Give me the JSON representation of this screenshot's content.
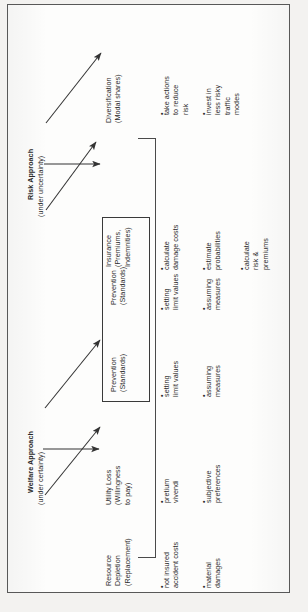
{
  "diagram": {
    "type": "flow-diagram",
    "orientation": "rotated-90-ccw",
    "title_note": "Valuation approaches for external effects",
    "approaches": [
      {
        "id": "risk",
        "heading": "Risk Approach",
        "subheading": "(under uncertainty)",
        "branches": [
          {
            "id": "diversification",
            "label_line1": "Diversification",
            "label_line2": "(Modal shares)",
            "boxed": false,
            "bullets": [
              {
                "marker": "•",
                "lines": [
                  "take actions",
                  "to reduce",
                  "risk"
                ]
              },
              {
                "marker": "•",
                "lines": [
                  "invest in",
                  "less risky",
                  "traffic",
                  "modes"
                ]
              }
            ]
          },
          {
            "id": "insurance",
            "label_line1": "Insurance",
            "label_line2": "(Premiums,",
            "label_line3": "Indemnities)",
            "boxed": false,
            "bullets": [
              {
                "marker": "•",
                "lines": [
                  "calculate",
                  "damage costs"
                ]
              },
              {
                "marker": "•",
                "lines": [
                  "estimate",
                  "probabilities"
                ]
              },
              {
                "marker": "•",
                "lines": [
                  "calculate",
                  "risk &",
                  "premiums"
                ]
              }
            ]
          },
          {
            "id": "prevention-risk",
            "label_line1": "Prevention",
            "label_line2": "(Standards)",
            "boxed": true,
            "bullets": [
              {
                "marker": "•",
                "lines": [
                  "setting",
                  "limit values"
                ]
              },
              {
                "marker": "•",
                "lines": [
                  "assuming",
                  "measures"
                ]
              }
            ]
          }
        ]
      },
      {
        "id": "welfare",
        "heading": "Welfare Approach",
        "subheading": "(under certainty)",
        "branches": [
          {
            "id": "prevention-welfare",
            "label_line1": "Prevention",
            "label_line2": "(Standards)",
            "boxed": true,
            "bullets": [
              {
                "marker": "•",
                "lines": [
                  "setting",
                  "limit values"
                ]
              },
              {
                "marker": "•",
                "lines": [
                  "assuming",
                  "measures"
                ]
              }
            ]
          },
          {
            "id": "utility-loss",
            "label_line1": "Utility Loss",
            "label_line2": "(Willingness",
            "label_line3": "to   pay)",
            "boxed": false,
            "bullets": [
              {
                "marker": "•",
                "lines": [
                  "pretium",
                  "vivendi"
                ]
              },
              {
                "marker": "•",
                "lines": [
                  "subjective",
                  "preferences"
                ]
              }
            ]
          },
          {
            "id": "resource-depletion",
            "label_line1": "Resource",
            "label_line2": "Depletion",
            "label_line3": "(Replacement)",
            "boxed": false,
            "bullets": [
              {
                "marker": "•",
                "lines": [
                  "not insured",
                  "accident costs"
                ]
              },
              {
                "marker": "•",
                "lines": [
                  "material",
                  "damages"
                ]
              }
            ]
          }
        ]
      }
    ],
    "colors": {
      "ink": "#2b2b2b",
      "rule": "#4a4a4a",
      "frame": "#585858",
      "paper": "#fdfdfc",
      "background": "#f3f2f0"
    }
  }
}
